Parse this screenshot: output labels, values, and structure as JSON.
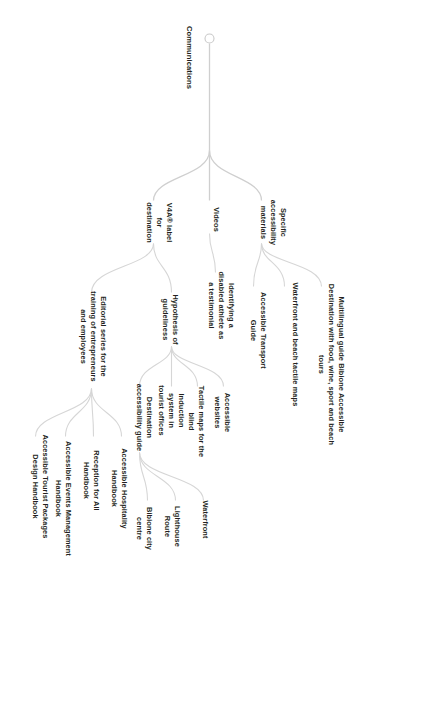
{
  "diagram": {
    "type": "mind-map",
    "orientation": "rotated-90-clockwise",
    "root": "Communications",
    "colors": {
      "text": "#231f20",
      "branch": "#d6d6d6",
      "background": "#ffffff"
    },
    "nodes": {
      "root": "Communications",
      "b1": "Specific accessibility materials",
      "b1_c1": "Multilingual guide Bibione Accessible Destination with food, wine, sport and beach tours",
      "b1_c2": "Waterfront and beach tactile maps",
      "b1_c3": "Accessible Transport Guide",
      "b2": "Videos",
      "b2_c1": "Identifying a disabled athlete as a testimonial",
      "b3": "V4A® label for destination",
      "b3_c1": "Hypothesis of guideliness",
      "b3_c1_d1": "Accessible websites",
      "b3_c1_d2": "Tactile maps for the blind",
      "b3_c1_d3": "Induction system in tourist offices",
      "b3_c1_d4": "Destination accessibility guide",
      "b3_c1_d4_e1": "Waterfront",
      "b3_c1_d4_e2": "Lighthouse Route",
      "b3_c1_d4_e3": "Bibione city centre",
      "b3_c2": "Editorial series for the training of entrepreneurs and employees",
      "b3_c2_d1": "Accessible Hospitality Handbook",
      "b3_c2_d2": "Reception for All Handbook",
      "b3_c2_d3": "Accessible Events Management Handbook",
      "b3_c2_d4": "Accessible Tourist Packages Design Handbook"
    }
  }
}
